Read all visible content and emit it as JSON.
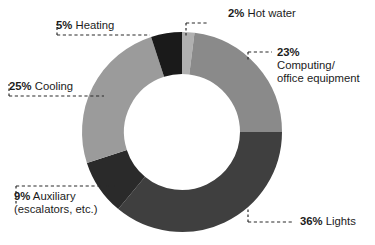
{
  "chart_data": {
    "type": "pie",
    "variant": "donut",
    "title": "",
    "subtitle": "",
    "xlabel": "",
    "ylabel": "",
    "units": "%",
    "total": 100,
    "grid": false,
    "legend_position": "callout-labels",
    "start_angle_deg": 0,
    "direction": "clockwise",
    "center": {
      "x": 182,
      "y": 132
    },
    "outer_radius": 100,
    "inner_radius": 58,
    "categories": [
      "Hot water",
      "Computing/office equipment",
      "Lights",
      "Auxiliary (escalators, etc.)",
      "Cooling",
      "Heating"
    ],
    "values": [
      2,
      23,
      36,
      9,
      25,
      5
    ],
    "colors": [
      "#b0b0b0",
      "#8a8a8a",
      "#3f3f3f",
      "#2a2a2a",
      "#9b9b9b",
      "#1a1a1a"
    ],
    "slices": [
      {
        "label": "Hot water",
        "value": 2,
        "display_value": "2%",
        "color": "#b0b0b0"
      },
      {
        "label": "Computing/ office equipment",
        "value": 23,
        "display_value": "23%",
        "color": "#8a8a8a"
      },
      {
        "label": "Lights",
        "value": 36,
        "display_value": "36%",
        "color": "#3f3f3f"
      },
      {
        "label": "Auxiliary (escalators, etc.)",
        "value": 9,
        "display_value": "9%",
        "color": "#2a2a2a"
      },
      {
        "label": "Cooling",
        "value": 25,
        "display_value": "25%",
        "color": "#9b9b9b"
      },
      {
        "label": "Heating",
        "value": 5,
        "display_value": "5%",
        "color": "#1a1a1a"
      }
    ]
  },
  "callouts": {
    "hot_water": {
      "pct": "2%",
      "name": "Hot water"
    },
    "computing": {
      "pct": "23%",
      "name_line1": "Computing/",
      "name_line2": "office equipment"
    },
    "lights": {
      "pct": "36%",
      "name": "Lights"
    },
    "auxiliary": {
      "pct": "9%",
      "name_line1": "Auxiliary",
      "name_line2": "(escalators, etc.)"
    },
    "cooling": {
      "pct": "25%",
      "name": "Cooling"
    },
    "heating": {
      "pct": "5%",
      "name": "Heating"
    }
  },
  "style": {
    "background": "#ffffff",
    "text_color": "#1c1c1c",
    "leader_color": "#2b2b2b"
  }
}
